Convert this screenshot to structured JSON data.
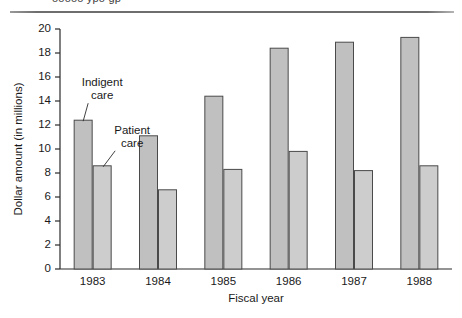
{
  "figure": {
    "clipped_header_text": "ooooo  ypo gp",
    "rule": "top-horizontal-rule"
  },
  "chart_data": {
    "type": "bar",
    "title": "",
    "subtitle": "",
    "xlabel": "Fiscal year",
    "ylabel": "Dollar amount (in millions)",
    "categories": [
      "1983",
      "1984",
      "1985",
      "1986",
      "1987",
      "1988"
    ],
    "series": [
      {
        "name": "Indigent care",
        "values": [
          12.4,
          11.1,
          14.4,
          18.4,
          18.9,
          19.3
        ],
        "color": "#c0c0c0"
      },
      {
        "name": "Patient care",
        "values": [
          8.6,
          6.6,
          8.3,
          9.8,
          8.2,
          8.6
        ],
        "color": "#cdcdcd"
      }
    ],
    "ylim": [
      0,
      20
    ],
    "ytick_values": [
      "0",
      "2",
      "4",
      "6",
      "8",
      "10",
      "12",
      "14",
      "16",
      "18",
      "20"
    ],
    "ytick_step": 2,
    "grid": false,
    "legend_position": "annotations-inline",
    "annotations": [
      {
        "text_line1": "Indigent",
        "text_line2": "care",
        "target_series": "Indigent care",
        "target_category": "1983"
      },
      {
        "text_line1": "Patient",
        "text_line2": "care",
        "target_series": "Patient care",
        "target_category": "1983"
      }
    ],
    "colors": {
      "bar_indigent": "#c0c0c0",
      "bar_patient": "#cdcdcd",
      "bar_stroke": "#4a4a4a",
      "axis": "#2b2b2b",
      "text": "#1a1a1a"
    }
  }
}
